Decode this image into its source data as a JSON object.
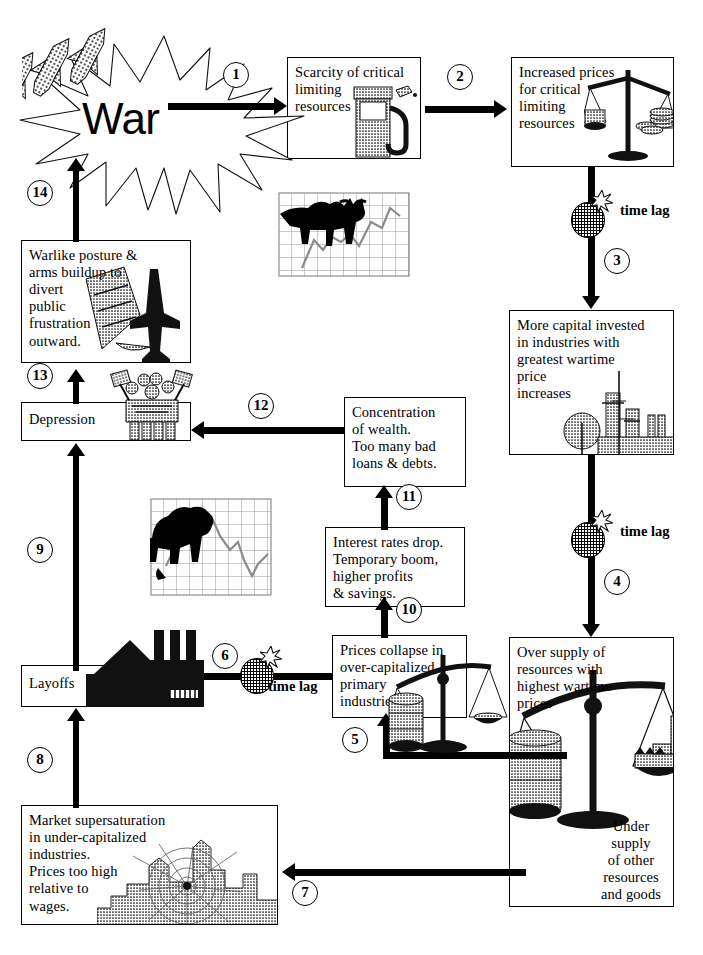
{
  "diagram": {
    "central_label": "War",
    "lag_label": "time\nlag"
  },
  "nodes": [
    {
      "id": "war",
      "label": "War",
      "icon": "explosion-star-icon"
    },
    {
      "id": "scarcity",
      "label": "Scarcity of critical\nlimiting\nresources",
      "icon": "gas-pump-icon"
    },
    {
      "id": "prices",
      "label": "Increased prices\nfor critical\nlimiting\nresources",
      "icon": "balance-scale-icon"
    },
    {
      "id": "capital",
      "label": "More capital invested\nin industries with\ngreatest wartime\nprice\nincreases",
      "icon": "refinery-icon"
    },
    {
      "id": "oversupply",
      "label": "Over supply of\nresources with\nhighest  wartime\nprices",
      "icon": "balance-scale-icon",
      "sublabel": "Under\nsupply\nof other\nresources\nand goods"
    },
    {
      "id": "collapse",
      "label": "Prices collapse in\nover-capitalized\nprimary\nindustries",
      "icon": "balance-scale-icon"
    },
    {
      "id": "market",
      "label": "Market supersaturation\nin under-capitalized\nindustries.\nPrices too high\nrelative to\nwages.",
      "icon": "cobweb-city-icon"
    },
    {
      "id": "layoffs",
      "label": "Layoffs",
      "icon": "factory-icon"
    },
    {
      "id": "interest",
      "label": "Interest rates drop.\nTemporary boom,\nhigher profits\n& savings.",
      "icon": "none"
    },
    {
      "id": "wealth",
      "label": "Concentration\nof wealth.\nToo many bad\nloans & debts.",
      "icon": "none"
    },
    {
      "id": "depression",
      "label": "Depression",
      "icon": "protest-crowd-icon"
    },
    {
      "id": "warlike",
      "label": "Warlike posture &\narms buildup to\ndivert\npublic\nfrustration\noutward.",
      "icon": "fighter-jet-icon"
    }
  ],
  "steps": [
    {
      "n": "1",
      "from": "war",
      "to": "scarcity",
      "time_lag": false
    },
    {
      "n": "2",
      "from": "scarcity",
      "to": "prices",
      "time_lag": false
    },
    {
      "n": "3",
      "from": "prices",
      "to": "capital",
      "time_lag": true
    },
    {
      "n": "4",
      "from": "capital",
      "to": "oversupply",
      "time_lag": true
    },
    {
      "n": "5",
      "from": "oversupply",
      "to": "collapse",
      "time_lag": false
    },
    {
      "n": "6",
      "from": "collapse",
      "to": "layoffs",
      "time_lag": true
    },
    {
      "n": "7",
      "from": "oversupply",
      "to": "market",
      "time_lag": false
    },
    {
      "n": "8",
      "from": "market",
      "to": "layoffs",
      "time_lag": false
    },
    {
      "n": "9",
      "from": "layoffs",
      "to": "depression",
      "time_lag": false
    },
    {
      "n": "10",
      "from": "collapse",
      "to": "interest",
      "time_lag": false
    },
    {
      "n": "11",
      "from": "interest",
      "to": "wealth",
      "time_lag": false
    },
    {
      "n": "12",
      "from": "wealth",
      "to": "depression",
      "time_lag": false
    },
    {
      "n": "13",
      "from": "depression",
      "to": "warlike",
      "time_lag": false
    },
    {
      "n": "14",
      "from": "warlike",
      "to": "war",
      "time_lag": false
    }
  ],
  "illustrations": [
    {
      "id": "bull-chart",
      "name": "bull-market-chart-icon",
      "caption": ""
    },
    {
      "id": "bear-chart",
      "name": "bear-market-chart-icon",
      "caption": ""
    }
  ],
  "colors": {
    "ink": "#000000",
    "paper": "#ffffff",
    "halftone": "#9a9a9a"
  }
}
